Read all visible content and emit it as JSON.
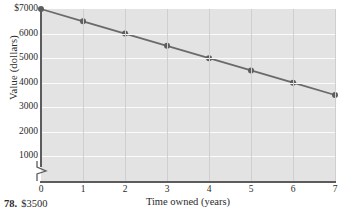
{
  "chart_data": {
    "type": "line",
    "title": "",
    "xlabel": "Time owned (years)",
    "ylabel": "Value (dollars)",
    "x": [
      0,
      1,
      2,
      3,
      4,
      5,
      6,
      7
    ],
    "values": [
      7000,
      6500,
      6000,
      5500,
      5000,
      4500,
      4000,
      3500
    ],
    "series": [
      {
        "name": "Value",
        "values": [
          7000,
          6500,
          6000,
          5500,
          5000,
          4500,
          4000,
          3500
        ]
      }
    ],
    "xlim": [
      0,
      7
    ],
    "ylim": [
      0,
      7000
    ],
    "xticks": [
      "0",
      "1",
      "2",
      "3",
      "4",
      "5",
      "6",
      "7"
    ],
    "yticks": [
      "1000",
      "2000",
      "3000",
      "4000",
      "5000",
      "6000",
      "$7000"
    ],
    "ytick_values": [
      1000,
      2000,
      3000,
      4000,
      5000,
      6000,
      7000
    ],
    "grid": true,
    "legend": "none",
    "axis_break": true,
    "line_color": "#6a6a6a",
    "marker_color": "#5e5e5e",
    "plot_background": "#e3e3e3",
    "hgrid_color": "#fbfbfb",
    "vgrid_color": "#cfcfcf"
  },
  "annotation": {
    "number": "78.",
    "answer": "$3500"
  }
}
